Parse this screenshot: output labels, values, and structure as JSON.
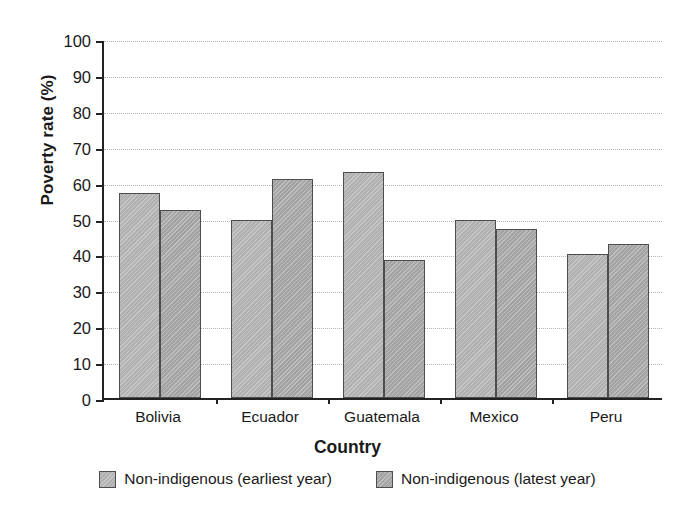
{
  "chart_data": {
    "type": "bar",
    "title": "",
    "xlabel": "Country",
    "ylabel": "Poverty rate (%)",
    "categories": [
      "Bolivia",
      "Ecuador",
      "Guatemala",
      "Mexico",
      "Peru"
    ],
    "series": [
      {
        "name": "Non-indigenous (earliest year)",
        "color": "#b0b0b0",
        "values": [
          57,
          49.5,
          63,
          49.5,
          40.2
        ]
      },
      {
        "name": "Non-indigenous (latest year)",
        "color": "#a3a3a3",
        "values": [
          52.5,
          61,
          38.5,
          47,
          43
        ]
      }
    ],
    "ylim": [
      0,
      100
    ],
    "ytick_labels": [
      "100",
      "90",
      "80",
      "70",
      "60",
      "50",
      "40",
      "30",
      "20",
      "10",
      "0"
    ],
    "ytick_values": [
      100,
      90,
      80,
      70,
      60,
      50,
      40,
      30,
      20,
      10,
      0
    ],
    "grid": "horizontal-dotted",
    "legend_position": "bottom"
  }
}
